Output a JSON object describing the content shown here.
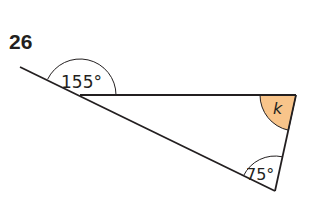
{
  "problem": {
    "number": "26"
  },
  "figure": {
    "type": "triangle",
    "angles": [
      {
        "id": "exterior-top-left",
        "label": "155°",
        "value": 155,
        "kind": "exterior"
      },
      {
        "id": "top-right",
        "label": "k",
        "value": null,
        "kind": "unknown",
        "highlighted": true
      },
      {
        "id": "bottom",
        "label": "75°",
        "value": 75,
        "kind": "interior"
      }
    ],
    "colors": {
      "line": "#231f20",
      "highlight_fill": "#f8c48a"
    }
  }
}
